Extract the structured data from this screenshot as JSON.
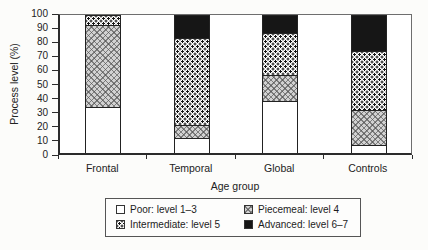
{
  "chart_data": {
    "type": "stacked-bar",
    "title": "",
    "xlabel": "Age group",
    "ylabel": "Process level (%)",
    "ylim": [
      0,
      100
    ],
    "yticks": [
      0,
      10,
      20,
      30,
      40,
      50,
      60,
      70,
      80,
      90,
      100
    ],
    "grid": false,
    "legend_position": "bottom-box",
    "categories": [
      "Frontal",
      "Temporal",
      "Global",
      "Controls"
    ],
    "series": [
      {
        "name": "Poor: level 1–3",
        "pattern": "white",
        "values": [
          33,
          10,
          37,
          5
        ]
      },
      {
        "name": "Piecemeal: level 4",
        "pattern": "gray-checker",
        "values": [
          60,
          10,
          19,
          26
        ]
      },
      {
        "name": "Intermediate: level 5",
        "pattern": "dots",
        "values": [
          7,
          63,
          31,
          43
        ]
      },
      {
        "name": "Advanced: level 6–7",
        "pattern": "black",
        "values": [
          0,
          17,
          13,
          26
        ]
      }
    ],
    "colors": {
      "frame": "#2b2b2b",
      "text": "#1c1c1c",
      "advanced_fill": "#161616",
      "checker_gray": "#d2d2d2",
      "dot_color": "#141414",
      "background": "#fcfcfa"
    }
  }
}
